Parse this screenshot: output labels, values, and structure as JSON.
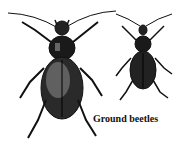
{
  "image": {
    "subject": "Illustration of two ground beetles",
    "caption": "Ground beetles",
    "colors": {
      "ink": "#111111",
      "background": "#ffffff",
      "shade": "#3a3a3a"
    }
  }
}
